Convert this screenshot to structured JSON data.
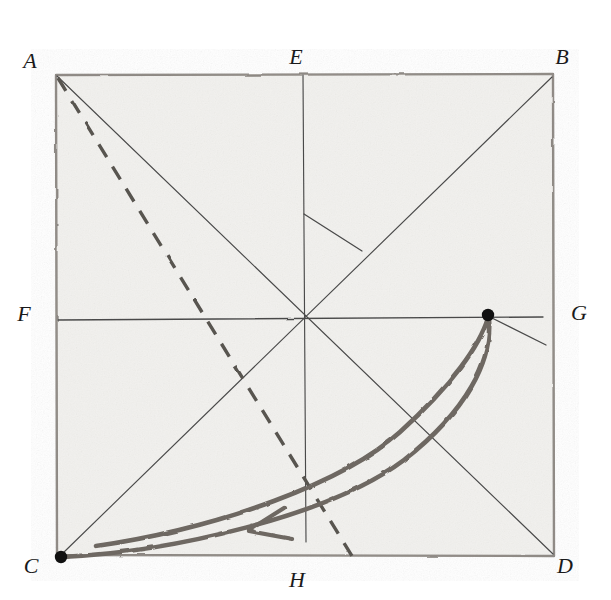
{
  "figure": {
    "medium": "pencil on textured paper",
    "background_color": "#ffffff",
    "paper_fill": "#f2f1ee",
    "ink_color": "#3a3a3a",
    "dark_ink_color": "#1a1a1a",
    "thick_stroke_color": "#6b6560",
    "square": {
      "left": 55,
      "top": 74,
      "right": 553,
      "bottom": 556
    },
    "labels": [
      {
        "id": "A",
        "text": "A",
        "x": 30,
        "y": 68,
        "corner": "top-left"
      },
      {
        "id": "E",
        "text": "E",
        "x": 296,
        "y": 64,
        "corner": "top-middle"
      },
      {
        "id": "B",
        "text": "B",
        "x": 559,
        "y": 64,
        "corner": "top-right"
      },
      {
        "id": "F",
        "text": "F",
        "x": 22,
        "y": 320,
        "corner": "left-middle"
      },
      {
        "id": "G",
        "text": "G",
        "x": 573,
        "y": 318,
        "corner": "right-middle"
      },
      {
        "id": "C",
        "text": "C",
        "x": 28,
        "y": 573,
        "corner": "bottom-left"
      },
      {
        "id": "H",
        "text": "H",
        "x": 289,
        "y": 585,
        "corner": "bottom-middle"
      },
      {
        "id": "D",
        "text": "D",
        "x": 560,
        "y": 573,
        "corner": "bottom-right"
      }
    ],
    "points": [
      {
        "id": "dot-G",
        "x": 488,
        "y": 315,
        "radius": 6,
        "description": "filled dot near right edge on line F-G"
      },
      {
        "id": "dot-C",
        "x": 61,
        "y": 557,
        "radius": 6,
        "description": "filled dot at bottom-left corner C"
      }
    ],
    "lines": [
      {
        "id": "diagonal-A-D",
        "from": "A",
        "to": "D",
        "style": "solid"
      },
      {
        "id": "diagonal-C-B",
        "from": "C",
        "to": "B",
        "style": "solid"
      },
      {
        "id": "median-E-H",
        "from": "E",
        "to": "H",
        "style": "solid",
        "note": "vertical, stops short of bottom edge"
      },
      {
        "id": "median-F-G",
        "from": "F",
        "to": "G",
        "style": "solid",
        "note": "horizontal through centre"
      },
      {
        "id": "dashed-A-H",
        "from": "A",
        "to": "near H",
        "style": "dashed",
        "note": "dashed line from A to bottom edge right of H"
      },
      {
        "id": "short-segment-vertical-to-diagonal",
        "from": "(304,214)",
        "to": "(362,250)",
        "style": "solid",
        "note": "short connector stroke"
      },
      {
        "id": "short-segment-dot-to-edge",
        "from": "dot-G",
        "to": "(546,344)",
        "style": "solid",
        "note": "short stroke from dot toward right edge"
      }
    ],
    "curves": [
      {
        "id": "crescent-upper",
        "description": "thick curved stroke from dot-G sweeping down-left to near C"
      },
      {
        "id": "crescent-lower",
        "description": "thick curved stroke from dot-G sweeping down-left to C, wider arc"
      }
    ],
    "arrow": {
      "id": "arrowhead",
      "tip_x": 248,
      "tip_y": 530,
      "direction": "left",
      "description": "arrowhead indicating direction of motion along the crescent"
    },
    "center": {
      "x": 306,
      "y": 318
    }
  }
}
